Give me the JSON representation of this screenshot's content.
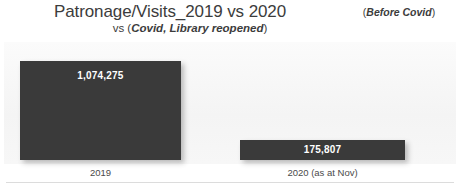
{
  "title": {
    "main": "Patronage/Visits_2019 vs 2020",
    "note_open": "(",
    "note_text": "Before Covid",
    "note_close": ")"
  },
  "subtitle": {
    "lead": "vs (",
    "emphasis": "Covid, Library reopened",
    "trail": ")"
  },
  "axis": {
    "categories": [
      "2019",
      "2020 (as at Nov)"
    ]
  },
  "bars": [
    {
      "category": "2019",
      "value_label": "1,074,275",
      "value": 1074275
    },
    {
      "category": "2020 (as at Nov)",
      "value_label": "175,807",
      "value": 175807
    }
  ],
  "colors": {
    "bar": "#3a3a3a",
    "bar_value_text": "#ffffff",
    "plot_background": "#f5f5f5",
    "page_background": "#ffffff",
    "text": "#3c3c3c",
    "rule": "#dcdcdc"
  },
  "chart_data": {
    "type": "bar",
    "title": "Patronage/Visits_2019 vs 2020 (Before Covid)",
    "subtitle": "vs (Covid, Library reopened)",
    "categories": [
      "2019",
      "2020 (as at Nov)"
    ],
    "values": [
      1074275,
      175807
    ],
    "data_labels": [
      "1,074,275",
      "175,807"
    ],
    "series": [
      {
        "name": "Patronage/Visits",
        "values": [
          1074275,
          175807
        ]
      }
    ],
    "xlabel": "",
    "ylabel": "",
    "ylim": [
      0,
      1074275
    ],
    "grid": false,
    "legend": false,
    "orientation": "vertical",
    "annotations": [
      "(Before Covid) applies to 2019",
      "(Covid, Library reopened) applies to 2020"
    ]
  }
}
